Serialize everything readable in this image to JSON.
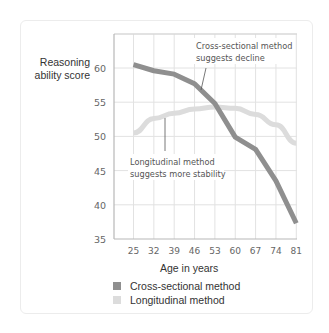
{
  "chart_data": {
    "type": "line",
    "title": "",
    "xlabel": "Age in years",
    "ylabel": "Reasoning ability score",
    "ylabel_lines": [
      "Reasoning",
      "ability score"
    ],
    "x": [
      25,
      32,
      39,
      46,
      53,
      60,
      67,
      74,
      81
    ],
    "x_tick_labels": [
      "25",
      "32",
      "39",
      "46",
      "53",
      "60",
      "67",
      "74",
      "81"
    ],
    "y_ticks": [
      35,
      40,
      45,
      50,
      55,
      60
    ],
    "y_tick_labels": [
      "35",
      "40",
      "45",
      "50",
      "55",
      "60"
    ],
    "ylim": [
      35,
      65
    ],
    "grid": true,
    "series": [
      {
        "name": "Cross-sectional method",
        "color": "#8f8f8f",
        "values": [
          60.5,
          59.6,
          59.1,
          57.7,
          54.8,
          49.9,
          48.1,
          43.5,
          37.3
        ]
      },
      {
        "name": "Longitudinal method",
        "color": "#dcdcdc",
        "values": [
          50.5,
          52.6,
          53.4,
          54.0,
          54.3,
          54.1,
          53.2,
          51.7,
          49.0
        ]
      }
    ],
    "annotations": [
      {
        "lines": [
          "Cross-sectional method",
          "suggests decline"
        ],
        "target_series": "Cross-sectional method"
      },
      {
        "lines": [
          "Longitudinal method",
          "suggests more stability"
        ],
        "target_series": "Longitudinal method"
      }
    ],
    "legend": {
      "position": "bottom",
      "entries": [
        "Cross-sectional method",
        "Longitudinal method"
      ]
    }
  }
}
